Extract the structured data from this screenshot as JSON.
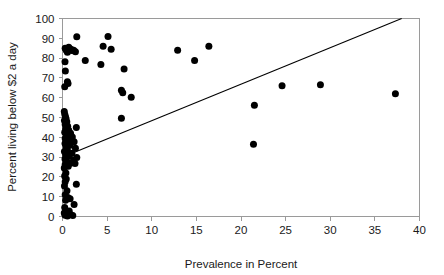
{
  "chart_data": {
    "type": "scatter",
    "title": "",
    "xlabel": "Prevalence in Percent",
    "ylabel": "Percent living below $2 a day",
    "xlim": [
      0,
      40
    ],
    "ylim": [
      0,
      100
    ],
    "xticks": [
      0,
      5,
      10,
      15,
      20,
      25,
      30,
      35,
      40
    ],
    "yticks": [
      0,
      10,
      20,
      30,
      40,
      50,
      60,
      70,
      80,
      90,
      100
    ],
    "grid": false,
    "legend": null,
    "marker": {
      "shape": "circle",
      "color": "#000000",
      "size_px": 4.6
    },
    "trend_line": {
      "type": "linear",
      "color": "#000000",
      "x": [
        0.05,
        38.0
      ],
      "y": [
        30.0,
        100.0
      ],
      "intercept": 29.9,
      "slope": 1.845
    },
    "points": [
      [
        0.3,
        85.0
      ],
      [
        0.42,
        84.0
      ],
      [
        0.55,
        83.0
      ],
      [
        0.7,
        85.5
      ],
      [
        0.95,
        84.5
      ],
      [
        1.05,
        83.8
      ],
      [
        1.25,
        84.0
      ],
      [
        1.45,
        83.2
      ],
      [
        1.6,
        90.8
      ],
      [
        0.28,
        78.2
      ],
      [
        0.32,
        73.5
      ],
      [
        0.55,
        68.0
      ],
      [
        0.62,
        67.2
      ],
      [
        0.25,
        65.5
      ],
      [
        2.55,
        78.8
      ],
      [
        4.55,
        86.0
      ],
      [
        5.45,
        84.5
      ],
      [
        5.1,
        90.9
      ],
      [
        4.3,
        76.8
      ],
      [
        6.9,
        74.5
      ],
      [
        6.6,
        63.8
      ],
      [
        6.75,
        62.5
      ],
      [
        7.7,
        60.2
      ],
      [
        6.6,
        49.6
      ],
      [
        12.9,
        84.0
      ],
      [
        16.4,
        86.0
      ],
      [
        14.8,
        78.8
      ],
      [
        21.5,
        56.2
      ],
      [
        24.6,
        66.0
      ],
      [
        28.9,
        66.5
      ],
      [
        37.3,
        62.0
      ],
      [
        21.4,
        36.5
      ],
      [
        0.2,
        53.0
      ],
      [
        0.26,
        51.5
      ],
      [
        0.33,
        50.4
      ],
      [
        0.4,
        49.4
      ],
      [
        0.22,
        48.5
      ],
      [
        0.48,
        47.8
      ],
      [
        0.3,
        46.5
      ],
      [
        0.58,
        45.6
      ],
      [
        1.55,
        45.0
      ],
      [
        0.35,
        44.2
      ],
      [
        0.7,
        43.5
      ],
      [
        0.25,
        42.6
      ],
      [
        0.9,
        42.0
      ],
      [
        0.45,
        41.0
      ],
      [
        1.1,
        40.2
      ],
      [
        0.3,
        39.4
      ],
      [
        0.62,
        38.5
      ],
      [
        1.3,
        37.8
      ],
      [
        0.28,
        36.9
      ],
      [
        0.85,
        36.0
      ],
      [
        0.4,
        35.2
      ],
      [
        1.45,
        34.5
      ],
      [
        0.55,
        33.6
      ],
      [
        0.22,
        32.8
      ],
      [
        1.05,
        32.0
      ],
      [
        0.35,
        31.2
      ],
      [
        0.75,
        30.4
      ],
      [
        1.6,
        29.8
      ],
      [
        0.28,
        29.0
      ],
      [
        1.25,
        28.4
      ],
      [
        0.5,
        27.6
      ],
      [
        0.95,
        27.0
      ],
      [
        0.3,
        26.2
      ],
      [
        1.4,
        26.8
      ],
      [
        0.65,
        25.4
      ],
      [
        0.2,
        24.5
      ],
      [
        0.38,
        22.0
      ],
      [
        0.24,
        20.5
      ],
      [
        0.42,
        19.0
      ],
      [
        0.3,
        17.5
      ],
      [
        1.55,
        16.3
      ],
      [
        0.22,
        15.4
      ],
      [
        0.5,
        13.0
      ],
      [
        0.3,
        11.0
      ],
      [
        0.6,
        9.6
      ],
      [
        0.85,
        9.0
      ],
      [
        0.35,
        8.2
      ],
      [
        1.3,
        6.0
      ],
      [
        0.25,
        4.5
      ],
      [
        0.45,
        2.2
      ],
      [
        0.62,
        1.4
      ],
      [
        0.9,
        1.0
      ],
      [
        0.3,
        0.6
      ],
      [
        1.15,
        0.5
      ],
      [
        0.55,
        0.3
      ],
      [
        0.2,
        1.8
      ],
      [
        0.75,
        2.8
      ]
    ]
  }
}
